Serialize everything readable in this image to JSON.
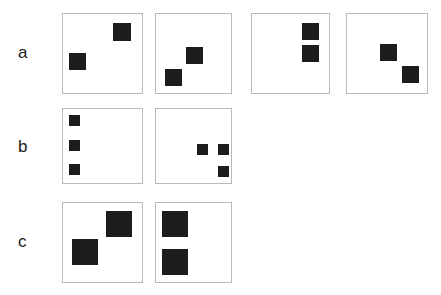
{
  "figure": {
    "background_color": "#ffffff",
    "panel_border_color": "#b9b9b9",
    "square_color": "#1c1c1c",
    "label_color": "#1b1b1b"
  },
  "rows": [
    {
      "label": "a",
      "label_x": 18,
      "label_y": 44,
      "panels": [
        {
          "name": "panel-a1",
          "x": 62,
          "y": 13,
          "w": 81,
          "h": 81,
          "squares": [
            {
              "x": 50,
              "y": 9,
              "size": 18
            },
            {
              "x": 6,
              "y": 39,
              "size": 17
            }
          ]
        },
        {
          "name": "panel-a2",
          "x": 155,
          "y": 13,
          "w": 77,
          "h": 81,
          "squares": [
            {
              "x": 30,
              "y": 33,
              "size": 17
            },
            {
              "x": 9,
              "y": 55,
              "size": 17
            }
          ]
        },
        {
          "name": "panel-a3",
          "x": 251,
          "y": 13,
          "w": 79,
          "h": 81,
          "squares": [
            {
              "x": 50,
              "y": 9,
              "size": 17
            },
            {
              "x": 50,
              "y": 31,
              "size": 17
            }
          ]
        },
        {
          "name": "panel-a4",
          "x": 346,
          "y": 13,
          "w": 82,
          "h": 81,
          "squares": [
            {
              "x": 33,
              "y": 30,
              "size": 17
            },
            {
              "x": 55,
              "y": 52,
              "size": 17
            }
          ]
        }
      ]
    },
    {
      "label": "b",
      "label_x": 18,
      "label_y": 138,
      "panels": [
        {
          "name": "panel-b1",
          "x": 62,
          "y": 108,
          "w": 81,
          "h": 76,
          "squares": [
            {
              "x": 6,
              "y": 6,
              "size": 11
            },
            {
              "x": 6,
              "y": 31,
              "size": 11
            },
            {
              "x": 6,
              "y": 55,
              "size": 11
            }
          ]
        },
        {
          "name": "panel-b2",
          "x": 155,
          "y": 108,
          "w": 77,
          "h": 76,
          "squares": [
            {
              "x": 41,
              "y": 35,
              "size": 11
            },
            {
              "x": 62,
              "y": 35,
              "size": 11
            },
            {
              "x": 62,
              "y": 57,
              "size": 11
            }
          ]
        }
      ]
    },
    {
      "label": "c",
      "label_x": 18,
      "label_y": 233,
      "panels": [
        {
          "name": "panel-c1",
          "x": 62,
          "y": 202,
          "w": 81,
          "h": 81,
          "squares": [
            {
              "x": 43,
              "y": 8,
              "size": 26
            },
            {
              "x": 9,
              "y": 36,
              "size": 26
            }
          ]
        },
        {
          "name": "panel-c2",
          "x": 155,
          "y": 202,
          "w": 77,
          "h": 81,
          "squares": [
            {
              "x": 6,
              "y": 8,
              "size": 26
            },
            {
              "x": 6,
              "y": 46,
              "size": 26
            }
          ]
        }
      ]
    }
  ]
}
